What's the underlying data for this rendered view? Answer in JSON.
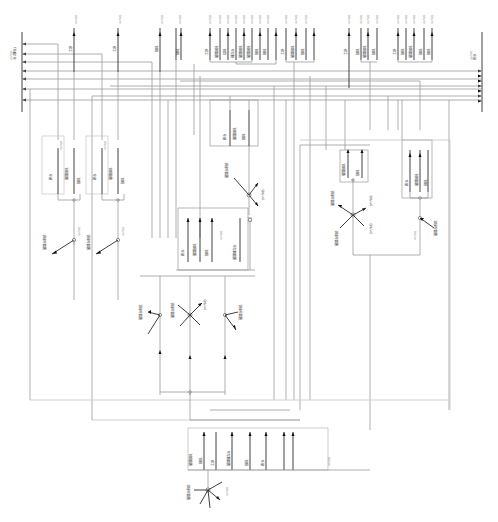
{
  "diagram": {
    "type": "water-balance-flow-network",
    "orientation": "rotated-90",
    "colors": {
      "line": "#9a9a9a",
      "arrow": "#111111",
      "background": "#ffffff",
      "label": "#333333"
    },
    "left_bus": {
      "label": "水 (取水)",
      "value_label": "(m³/d)",
      "arrow_count": 7
    },
    "right_bus": {
      "label": "排水",
      "value_label": "(m³/d)",
      "arrow_count": 7
    },
    "top_outlets": [
      {
        "label": "工序",
        "value": "(m³/d)"
      },
      {
        "label": "工序",
        "value": "(m³/d)"
      },
      {
        "label": "損耗",
        "value": "(m³/d)"
      },
      {
        "label": "損耗",
        "value": "(m³/d)"
      },
      {
        "label": "工序",
        "value": "(m³/d)"
      },
      {
        "label": "循環損耗",
        "value": "(m³/d)"
      },
      {
        "label": "损耗",
        "value": "(m³/d)"
      },
      {
        "label": "補充水",
        "value": "(m³/d)"
      },
      {
        "label": "循環損耗",
        "value": "(m³/d)"
      },
      {
        "label": "循環損耗",
        "value": "(m³/d)"
      },
      {
        "label": "損耗",
        "value": "(m³/d)"
      },
      {
        "label": "損耗",
        "value": "(m³/d)"
      },
      {
        "label": "工序",
        "value": "(m³/d)"
      },
      {
        "label": "循環損耗",
        "value": "(m³/d)"
      },
      {
        "label": "損耗",
        "value": "(m³/d)"
      },
      {
        "label": "工序",
        "value": "(m³/d)"
      },
      {
        "label": "損耗",
        "value": "(m³/d)"
      },
      {
        "label": "循環損耗",
        "value": "(m³/d)"
      },
      {
        "label": "損耗",
        "value": "(m³/d)"
      },
      {
        "label": "工序",
        "value": "(m³/d)"
      },
      {
        "label": "損耗",
        "value": "(m³/d)"
      },
      {
        "label": "循環損耗",
        "value": "(m³/d)"
      },
      {
        "label": "損耗",
        "value": "(m³/d)"
      },
      {
        "label": "損耗",
        "value": "(m³/d)"
      }
    ],
    "process_units": [
      {
        "id": "u1",
        "labels": [
          "新水",
          "循環損耗",
          "損耗"
        ],
        "value": "(m³/d)"
      },
      {
        "id": "u2",
        "labels": [
          "新水",
          "循環損耗",
          "損耗"
        ],
        "value": "(m³/d)"
      },
      {
        "id": "u3",
        "labels": [
          "新水",
          "循環損耗",
          "損耗",
          "循環補充水"
        ],
        "value": "(m³/d)"
      },
      {
        "id": "u4",
        "labels": [
          "新水",
          "循環損耗",
          "損耗"
        ],
        "value": "(m³/d)"
      },
      {
        "id": "u5",
        "labels": [
          "新水",
          "循環損耗",
          "損耗"
        ],
        "value": "(m³/d)"
      },
      {
        "id": "u6",
        "labels": [
          "循環損耗",
          "損耗",
          "工序",
          "循環補充水",
          "損耗",
          "新水"
        ],
        "value": "(m³/d)"
      }
    ],
    "hubs": [
      {
        "id": "h1",
        "label": "循環水系統",
        "value": "(m³/d)"
      },
      {
        "id": "h2",
        "label": "循環水系統",
        "value": "(m³/d)"
      },
      {
        "id": "h3",
        "label": "循環水系統",
        "value": "(m³/d)"
      },
      {
        "id": "h4",
        "label": "循環水系統",
        "value": "(m³/d)"
      },
      {
        "id": "h5",
        "label": "循環水系統",
        "value": "(m³/d)"
      },
      {
        "id": "h6",
        "label": "循環水系統",
        "value": "(m³/d)"
      },
      {
        "id": "h7",
        "label": "循環水系統",
        "value": "(m³/d)"
      },
      {
        "id": "h8",
        "label": "循環水系統",
        "value": "(m³/d)"
      }
    ],
    "unit_label": "(m³/d)"
  }
}
